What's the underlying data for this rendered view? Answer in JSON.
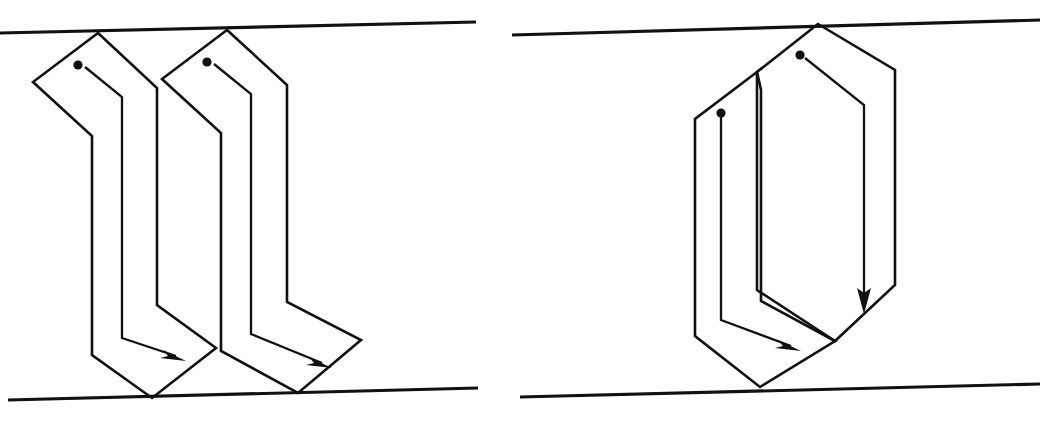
{
  "figure": {
    "background_color": "#ffffff",
    "stroke_color": "#111111",
    "width": 1044,
    "height": 421,
    "panel_count": 2
  },
  "panels": [
    {
      "id": "panel-left",
      "name": "left-panel",
      "label": "",
      "description": "Two adjacent zig-zag folded ribbon chains between slanted upper and lower boundary lines",
      "boundaries": {
        "top": {
          "name": "top-boundary-line",
          "x1": 0,
          "y1": 33,
          "x2": 476,
          "y2": 22
        },
        "bottom": {
          "name": "bottom-boundary-line",
          "x1": 8,
          "y1": 400,
          "x2": 478,
          "y2": 388
        }
      },
      "shapes": [
        {
          "id": "left-ribbon-1",
          "name": "folded-ribbon-1",
          "outer_path": "M 98 33 L 33 82 L 92 136 L 92 355 L 152 398 L 216 348 L 157 305 L 157 88 Z",
          "inner_path": "M 85 67 L 122 97 L 122 338 L 180 358",
          "dot": {
            "name": "chain-start-dot",
            "cx": 78,
            "cy": 65,
            "r": 4.6
          },
          "arrow": {
            "name": "chain-direction-arrow",
            "from_x": 85,
            "from_y": 67,
            "tip_x": 182,
            "tip_y": 360,
            "head_angle_deg": 20
          }
        },
        {
          "id": "left-ribbon-2",
          "name": "folded-ribbon-2",
          "outer_path": "M 227 30 L 162 79 L 221 133 L 221 351 L 298 393 L 361 340 L 287 302 L 287 85 Z",
          "inner_path": "M 214 64 L 251 94 L 251 334 L 326 365",
          "dot": {
            "name": "chain-start-dot",
            "cx": 207,
            "cy": 62,
            "r": 4.6
          },
          "arrow": {
            "name": "chain-direction-arrow",
            "from_x": 214,
            "from_y": 64,
            "tip_x": 328,
            "tip_y": 367,
            "head_angle_deg": 20
          }
        }
      ]
    },
    {
      "id": "panel-right",
      "name": "right-panel",
      "label": "",
      "description": "Two interleaved elongated hexagonal folded chains between slanted upper and lower boundary lines",
      "boundaries": {
        "top": {
          "name": "top-boundary-line",
          "x1": 512,
          "y1": 35,
          "x2": 1040,
          "y2": 20
        },
        "bottom": {
          "name": "bottom-boundary-line",
          "x1": 520,
          "y1": 397,
          "x2": 1040,
          "y2": 384
        }
      },
      "shapes": [
        {
          "id": "right-hexagon-outer",
          "name": "folded-hexagon-outer",
          "outer_path": "M 818 24 L 757 72 L 757 290 L 835 341 L 895 285 L 895 70 Z",
          "inner_path": "M 805 58 L 864 105 L 864 305",
          "dot": {
            "name": "chain-start-dot",
            "cx": 800,
            "cy": 55,
            "r": 4.6
          },
          "arrow": {
            "name": "chain-direction-arrow-vertical",
            "from_x": 805,
            "from_y": 58,
            "tip_x": 864,
            "tip_y": 312,
            "head_angle_deg": 14
          }
        },
        {
          "id": "right-hexagon-inner",
          "name": "folded-hexagon-inner",
          "outer_path": "M 757 72 L 695 119 L 695 336 L 760 387 L 835 341 L 761 301 L 761 90 Z",
          "inner_path": "M 721 113 L 721 320 L 795 348",
          "dot": {
            "name": "chain-start-dot",
            "cx": 721,
            "cy": 113,
            "r": 4.6
          },
          "arrow": {
            "name": "chain-direction-arrow-horizontal",
            "from_x": 721,
            "from_y": 113,
            "tip_x": 800,
            "tip_y": 350,
            "head_angle_deg": 20
          }
        }
      ]
    }
  ],
  "legend": {
    "dot_meaning": "chain start point",
    "arrow_meaning": "chain direction of traversal"
  }
}
